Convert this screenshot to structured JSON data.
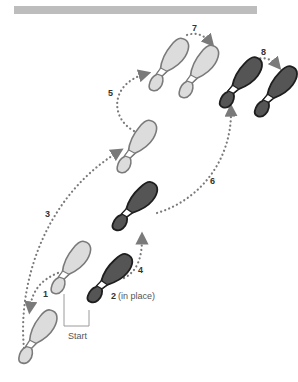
{
  "diagram": {
    "type": "dance-step-footprint-diagram",
    "header_bar_color": "#bdbdbd",
    "colors": {
      "light_fill": "#dcdcdc",
      "light_stroke": "#7a7a7a",
      "dark_fill": "#555555",
      "dark_stroke": "#1e1e1e",
      "arch": "#ffffff",
      "path": "#7a7a7a",
      "start_bracket": "#9a9a9a"
    },
    "steps": [
      {
        "number": "1",
        "label": "1"
      },
      {
        "number": "2",
        "label": "2",
        "note": "(in place)"
      },
      {
        "number": "3",
        "label": "3"
      },
      {
        "number": "4",
        "label": "4"
      },
      {
        "number": "5",
        "label": "5"
      },
      {
        "number": "6",
        "label": "6"
      },
      {
        "number": "7",
        "label": "7"
      },
      {
        "number": "8",
        "label": "8"
      }
    ],
    "start_label": "Start",
    "footprints": [
      {
        "id": "start-left",
        "shade": "light"
      },
      {
        "id": "start-right",
        "shade": "dark"
      },
      {
        "id": "step1-left",
        "shade": "light"
      },
      {
        "id": "step3-left",
        "shade": "light"
      },
      {
        "id": "step4-right",
        "shade": "dark"
      },
      {
        "id": "step5-left",
        "shade": "light"
      },
      {
        "id": "step7-left",
        "shade": "light"
      },
      {
        "id": "step6-right",
        "shade": "dark"
      },
      {
        "id": "step8-right",
        "shade": "dark"
      }
    ]
  }
}
